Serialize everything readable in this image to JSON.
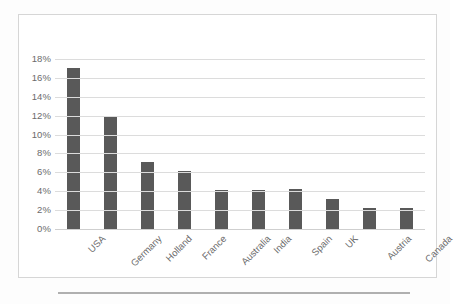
{
  "chart_data": {
    "type": "bar",
    "title": "",
    "subtitle": "",
    "xlabel": "",
    "ylabel": "",
    "categories": [
      "USA",
      "Germany",
      "Holland",
      "France",
      "Australia",
      "India",
      "Spain",
      "UK",
      "Austria",
      "Canada"
    ],
    "values": [
      17.0,
      12.0,
      7.1,
      6.1,
      4.1,
      4.1,
      4.2,
      3.2,
      2.2,
      2.2
    ],
    "value_labels": [
      "17%",
      "12%",
      "7.1%",
      "6.1%",
      "4.1%",
      "4.1%",
      "4.2%",
      "3.2%",
      "2.2%",
      "2.2%"
    ],
    "ylim": [
      0,
      18
    ],
    "ytick_labels": [
      "0%",
      "2%",
      "4%",
      "6%",
      "8%",
      "10%",
      "12%",
      "14%",
      "16%",
      "18%"
    ],
    "ytick_values": [
      0,
      2,
      4,
      6,
      8,
      10,
      12,
      14,
      16,
      18
    ],
    "grid": true,
    "legend": false,
    "legend_position": "none",
    "series": [
      {
        "name": "",
        "values": [
          17.0,
          12.0,
          7.1,
          6.1,
          4.1,
          4.1,
          4.2,
          3.2,
          2.2,
          2.2
        ]
      }
    ],
    "annotations": []
  },
  "style": {
    "bar_color": "#595959",
    "gridline_color": "#dcdcdc",
    "axis_text_color": "#6b6b6b",
    "frame_border_color": "#d6d6d6",
    "plot_background": "#ffffff",
    "page_background": "#fdfdfd",
    "rule_color": "#b0b0b0",
    "xlabel_rotation": "-45"
  }
}
